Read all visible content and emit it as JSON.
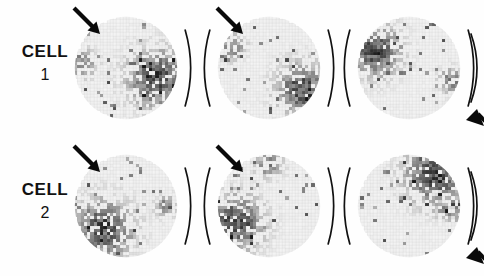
{
  "figure": {
    "rows": [
      {
        "id": "cell-1",
        "label_word": "CELL",
        "label_number": "1",
        "panels": [
          {
            "id": "cell1-panel1",
            "arrow": true,
            "arrow_angle_deg": 45,
            "arc_left": false,
            "arc_right": true,
            "edge_arrow": false,
            "hotspot": "right",
            "hot_cx": 0.8,
            "hot_cy": 0.6,
            "hot_radius": 0.3,
            "secondary_cx": 0.08,
            "secondary_cy": 0.45,
            "secondary_radius": 0.14,
            "seed": 11
          },
          {
            "id": "cell1-panel2",
            "arrow": true,
            "arrow_angle_deg": 45,
            "arc_left": true,
            "arc_right": true,
            "edge_arrow": false,
            "hotspot": "right-low",
            "hot_cx": 0.82,
            "hot_cy": 0.7,
            "hot_radius": 0.26,
            "secondary_cx": 0.14,
            "secondary_cy": 0.3,
            "secondary_radius": 0.13,
            "seed": 23
          },
          {
            "id": "cell1-panel3",
            "arrow": false,
            "arrow_angle_deg": 45,
            "arc_left": true,
            "arc_right": true,
            "edge_arrow": true,
            "hotspot": "left-upper",
            "hot_cx": 0.17,
            "hot_cy": 0.33,
            "hot_radius": 0.26,
            "secondary_cx": 0.9,
            "secondary_cy": 0.62,
            "secondary_radius": 0.12,
            "seed": 37
          }
        ]
      },
      {
        "id": "cell-2",
        "label_word": "CELL",
        "label_number": "2",
        "panels": [
          {
            "id": "cell2-panel1",
            "arrow": true,
            "arrow_angle_deg": 45,
            "arc_left": false,
            "arc_right": true,
            "edge_arrow": false,
            "hotspot": "bottom-left",
            "hot_cx": 0.28,
            "hot_cy": 0.72,
            "hot_radius": 0.3,
            "secondary_cx": 0.88,
            "secondary_cy": 0.5,
            "secondary_radius": 0.1,
            "seed": 51
          },
          {
            "id": "cell2-panel2",
            "arrow": true,
            "arrow_angle_deg": 45,
            "arc_left": true,
            "arc_right": true,
            "edge_arrow": false,
            "hotspot": "left-lower",
            "hot_cx": 0.18,
            "hot_cy": 0.66,
            "hot_radius": 0.28,
            "secondary_cx": 0.5,
            "secondary_cy": 0.1,
            "secondary_radius": 0.13,
            "seed": 67
          },
          {
            "id": "cell2-panel3",
            "arrow": false,
            "arrow_angle_deg": 45,
            "arc_left": true,
            "arc_right": true,
            "edge_arrow": true,
            "hotspot": "top-right",
            "hot_cx": 0.74,
            "hot_cy": 0.2,
            "hot_radius": 0.3,
            "secondary_cx": 0.92,
            "secondary_cy": 0.52,
            "secondary_radius": 0.14,
            "seed": 83
          }
        ]
      }
    ]
  },
  "chart_data": {
    "type": "heatmap",
    "grid_cells": 32,
    "panel_shape": "circle",
    "colormap": "grayscale-dark-is-high",
    "value_range": [
      0,
      1
    ],
    "rows": [
      "CELL 1",
      "CELL 2"
    ],
    "columns": [
      "condition 1",
      "condition 2",
      "condition 3"
    ],
    "hotspot_centers": [
      [
        [
          0.8,
          0.6
        ],
        [
          0.82,
          0.7
        ],
        [
          0.17,
          0.33
        ]
      ],
      [
        [
          0.28,
          0.72
        ],
        [
          0.18,
          0.66
        ],
        [
          0.74,
          0.2
        ]
      ]
    ],
    "annotations": {
      "arrow": "stimulus direction, pointing down-right at 45 degrees",
      "arc": "parenthesis-shaped arc bracketing the receptive field",
      "edge_arrow": "arrowhead at right image margin (cropped panel)"
    },
    "xlabel": "",
    "ylabel": "",
    "grid": true,
    "legend": "none"
  }
}
